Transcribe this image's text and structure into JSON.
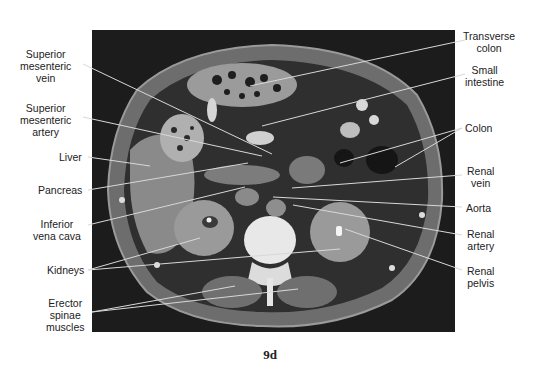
{
  "figure": {
    "caption": "9d",
    "image_description": "Axial CT scan of abdomen at the level of the kidneys"
  },
  "labels_left": [
    {
      "id": "superior-mesenteric-vein",
      "text": "Superior\nmesenteric\nvein"
    },
    {
      "id": "superior-mesenteric-artery",
      "text": "Superior\nmesenteric\nartery"
    },
    {
      "id": "liver",
      "text": "Liver"
    },
    {
      "id": "pancreas",
      "text": "Pancreas"
    },
    {
      "id": "inferior-vena-cava",
      "text": "Inferior\nvena cava"
    },
    {
      "id": "kidneys",
      "text": "Kidneys"
    },
    {
      "id": "erector-spinae-muscles",
      "text": "Erector\nspinae\nmuscles"
    }
  ],
  "labels_right": [
    {
      "id": "transverse-colon",
      "text": "Transverse\ncolon"
    },
    {
      "id": "small-intestine",
      "text": "Small\nintestine"
    },
    {
      "id": "colon",
      "text": "Colon"
    },
    {
      "id": "renal-vein",
      "text": "Renal\nvein"
    },
    {
      "id": "aorta",
      "text": "Aorta"
    },
    {
      "id": "renal-artery",
      "text": "Renal\nartery"
    },
    {
      "id": "renal-pelvis",
      "text": "Renal\npelvis"
    }
  ]
}
